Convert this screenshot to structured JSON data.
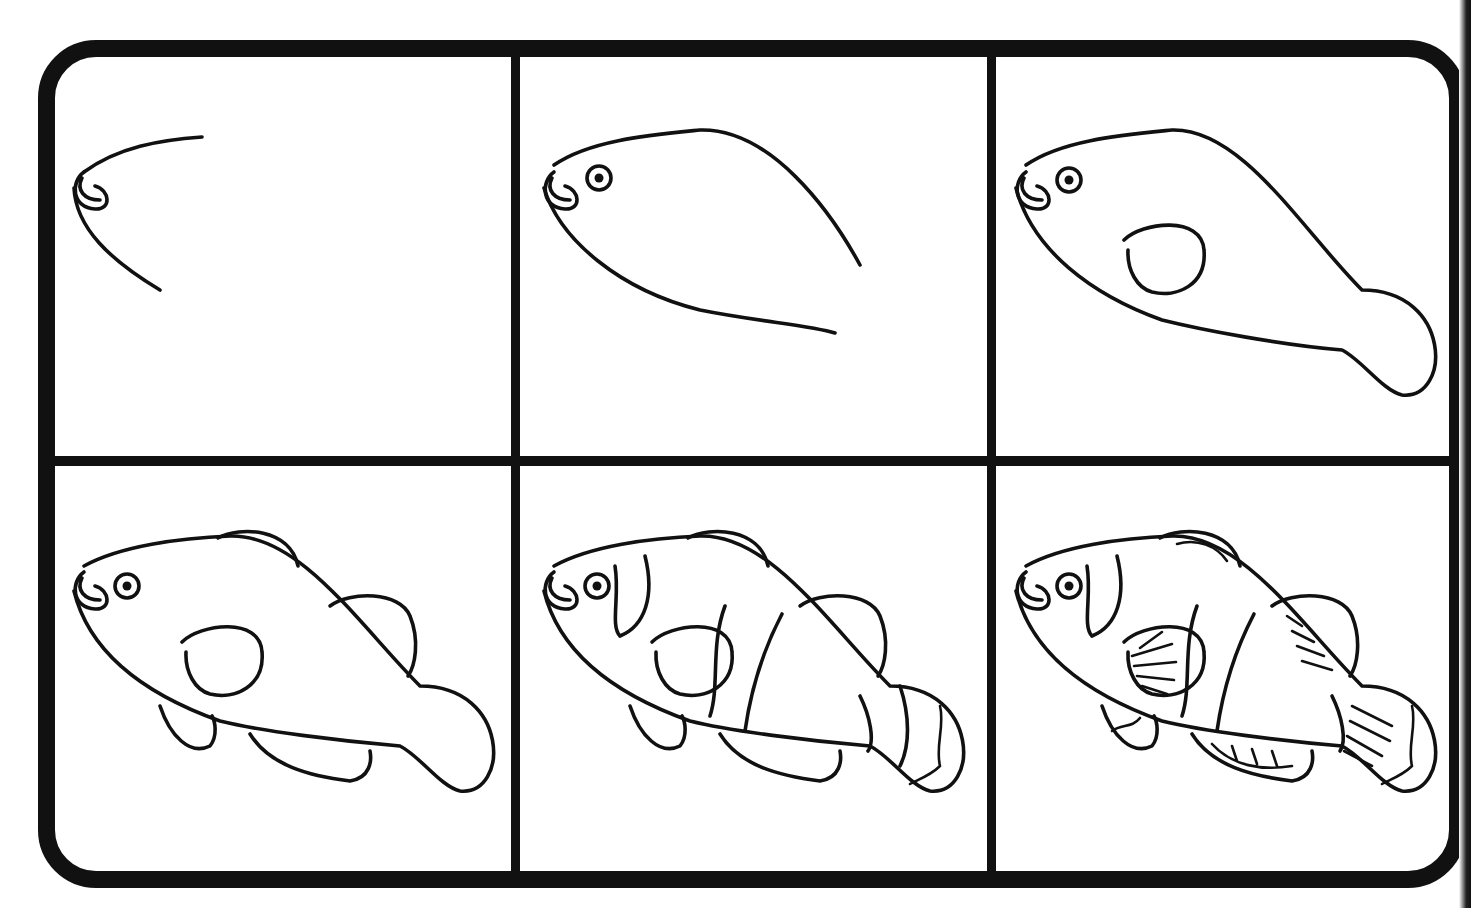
{
  "layout": {
    "rows": 2,
    "columns": 3
  },
  "colors": {
    "line": "#111111",
    "background": "#ffffff"
  },
  "steps": [
    {
      "step": 1,
      "label": "Step 1",
      "description": "Draw the curved forehead and chin with the mouth"
    },
    {
      "step": 2,
      "label": "Step 2",
      "description": "Add the eye and extend the body outline"
    },
    {
      "step": 3,
      "label": "Step 3",
      "description": "Draw the tail stem and the pectoral fin outline"
    },
    {
      "step": 4,
      "label": "Step 4",
      "description": "Add dorsal, pelvic, anal and caudal fins"
    },
    {
      "step": 5,
      "label": "Step 5",
      "description": "Add the three stripe bands and tail edge"
    },
    {
      "step": 6,
      "label": "Step 6",
      "description": "Add fin rays and wavy fin edge details"
    }
  ]
}
